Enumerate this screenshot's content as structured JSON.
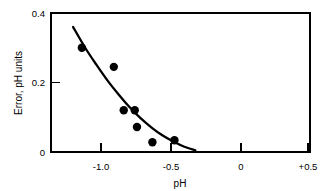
{
  "chart_data": {
    "type": "scatter",
    "title": "",
    "subtitle": "",
    "xlabel": "pH",
    "ylabel": "Error, pH units",
    "xlim": [
      -1.36,
      0.99
    ],
    "ylim": [
      0,
      0.4
    ],
    "xticks": [
      -1.0,
      -0.5,
      0,
      0.5
    ],
    "xtick_labels": [
      "-1.0",
      "-0.5",
      "0",
      "+0.5"
    ],
    "yticks": [
      0,
      0.2,
      0.4
    ],
    "ytick_labels": [
      "0",
      "0.2",
      "0.4"
    ],
    "grid": false,
    "legend": "none",
    "marker": "filled-circle",
    "marker_color": "#000000",
    "line_color": "#000000",
    "points": [
      {
        "x": -1.08,
        "y": 0.3
      },
      {
        "x": -0.79,
        "y": 0.245
      },
      {
        "x": -0.7,
        "y": 0.12
      },
      {
        "x": -0.6,
        "y": 0.12
      },
      {
        "x": -0.58,
        "y": 0.072
      },
      {
        "x": -0.44,
        "y": 0.028
      },
      {
        "x": -0.24,
        "y": 0.034
      }
    ],
    "series": [
      {
        "name": "fitted curve",
        "type": "line",
        "x": [
          -1.16,
          -1.05,
          -0.95,
          -0.85,
          -0.75,
          -0.65,
          -0.55,
          -0.45,
          -0.35,
          -0.25,
          -0.15,
          -0.05
        ],
        "y": [
          0.36,
          0.3,
          0.252,
          0.207,
          0.167,
          0.13,
          0.098,
          0.071,
          0.048,
          0.03,
          0.015,
          0.005
        ]
      }
    ],
    "annotations": []
  },
  "axes": {
    "x_title": "pH",
    "y_title": "Error, pH units",
    "x_tick_text": [
      "-1.0",
      "-0.5",
      "0",
      "+0.5"
    ],
    "y_tick_text": [
      "0.4",
      "0.2",
      "0"
    ]
  }
}
